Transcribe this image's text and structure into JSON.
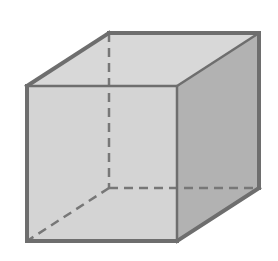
{
  "figure": {
    "colors": {
      "background": "#ffffff",
      "front_face": "#d4d4d4",
      "top_face": "#d8d8d8",
      "right_face": "#b2b2b2",
      "edge": "#6e6e6e",
      "hidden_edge": "#777777"
    },
    "vertices": {
      "front_top_left": [
        27,
        86
      ],
      "front_top_right": [
        177,
        86
      ],
      "front_bottom_left": [
        27,
        241
      ],
      "front_bottom_right": [
        177,
        241
      ],
      "back_top_left": [
        109,
        33
      ],
      "back_top_right": [
        259,
        33
      ],
      "back_bottom_left": [
        109,
        188
      ],
      "back_bottom_right": [
        259,
        188
      ]
    }
  }
}
